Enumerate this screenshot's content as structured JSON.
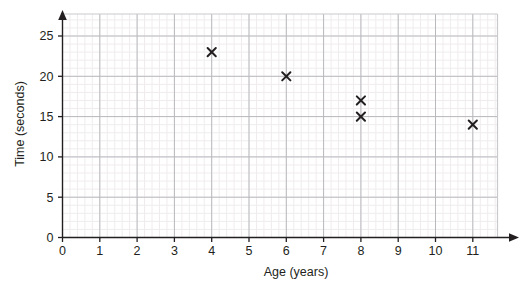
{
  "chart_data": {
    "type": "scatter",
    "title": "",
    "xlabel": "Age (years)",
    "ylabel": "Time (seconds)",
    "xlim": [
      0,
      11.8
    ],
    "ylim": [
      0,
      29
    ],
    "xticks": [
      0,
      1,
      2,
      3,
      4,
      5,
      6,
      7,
      8,
      9,
      10,
      11
    ],
    "xtick_labels": [
      "0",
      "1",
      "2",
      "3",
      "4",
      "5",
      "6",
      "7",
      "8",
      "9",
      "10",
      "11"
    ],
    "yticks": [
      0,
      5,
      10,
      15,
      20,
      25
    ],
    "ytick_labels": [
      "0",
      "5",
      "10",
      "15",
      "20",
      "25"
    ],
    "grid": true,
    "minor_grid": true,
    "minor_divisions": 5,
    "legend": null,
    "marker": "x",
    "points": [
      {
        "x": 4,
        "y": 23
      },
      {
        "x": 6,
        "y": 20
      },
      {
        "x": 8,
        "y": 17
      },
      {
        "x": 8,
        "y": 15
      },
      {
        "x": 11,
        "y": 14
      }
    ],
    "colors": {
      "marker": "#231f20",
      "axis": "#231f20",
      "major_grid": "#b9b9bd",
      "minor_grid": "#f0ecee",
      "plot_border": "#c9c9ce",
      "background": "#ffffff",
      "text": "#231f20"
    }
  }
}
